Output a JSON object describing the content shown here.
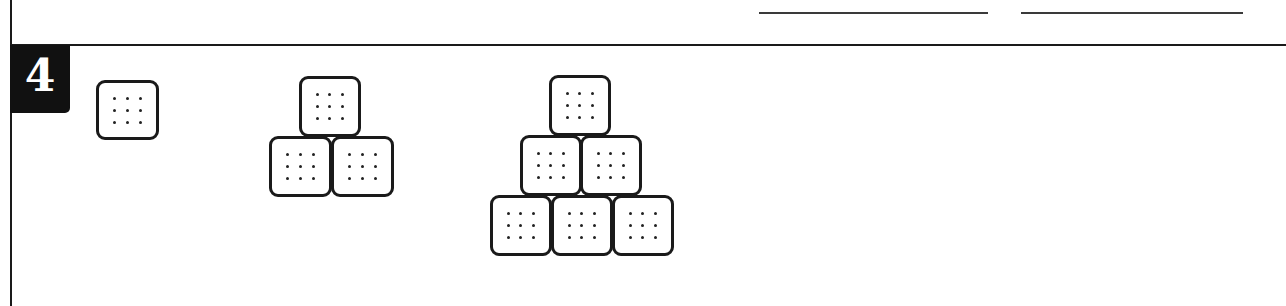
{
  "problem": {
    "number": "4",
    "answer_lines": [
      {
        "x": 759,
        "y": 12,
        "width": 229
      },
      {
        "x": 1021,
        "y": 12,
        "width": 222
      }
    ]
  },
  "figures": [
    {
      "name": "figure-1",
      "rows": 1,
      "total_crackers": 1,
      "crackers": [
        {
          "x": 96,
          "y": 80,
          "w": 63,
          "h": 60
        }
      ]
    },
    {
      "name": "figure-2",
      "rows": 2,
      "total_crackers": 3,
      "crackers": [
        {
          "x": 299,
          "y": 76,
          "w": 62,
          "h": 61
        },
        {
          "x": 269,
          "y": 136,
          "w": 63,
          "h": 61
        },
        {
          "x": 331,
          "y": 136,
          "w": 63,
          "h": 61
        }
      ]
    },
    {
      "name": "figure-3",
      "rows": 3,
      "total_crackers": 6,
      "crackers": [
        {
          "x": 549,
          "y": 75,
          "w": 62,
          "h": 61
        },
        {
          "x": 520,
          "y": 135,
          "w": 62,
          "h": 61
        },
        {
          "x": 580,
          "y": 135,
          "w": 62,
          "h": 61
        },
        {
          "x": 490,
          "y": 195,
          "w": 62,
          "h": 61
        },
        {
          "x": 551,
          "y": 195,
          "w": 62,
          "h": 61
        },
        {
          "x": 612,
          "y": 195,
          "w": 62,
          "h": 61
        }
      ]
    }
  ],
  "cracker_style": {
    "dots_per_cracker": 9,
    "dot_grid": "3x3",
    "outline_color": "#1a1a1a",
    "fill_color": "#ffffff"
  }
}
